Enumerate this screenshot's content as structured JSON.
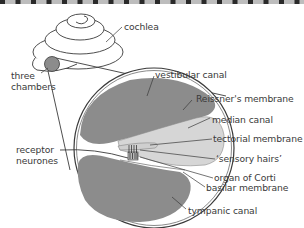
{
  "diagram": {
    "labels": {
      "cochlea": "cochlea",
      "three_chambers_1": "three",
      "three_chambers_2": "chambers",
      "vestibular_canal": "vestibular canal",
      "reissners_membrane": "Reissner's membrane",
      "median_canal": "median canal",
      "tectorial_membrane": "tectorial membrane",
      "sensory_hairs": "‘sensory hairs’",
      "organ_of_corti": "organ of Corti",
      "basilar_membrane": "basilar membrane",
      "tympanic_canal": "tympanic canal",
      "receptor_neurones_1": "receptor",
      "receptor_neurones_2": "neurones"
    },
    "colors": {
      "dark_fill": "#8c8c8c",
      "light_fill": "#d6d6d6",
      "outline": "#3a3a3a",
      "border_dash": "#2a2a2a",
      "border_bg": "#bdbdbd"
    }
  }
}
